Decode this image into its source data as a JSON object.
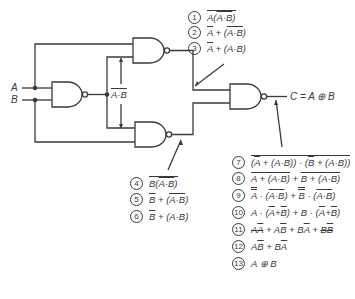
{
  "diagram": {
    "type": "logic-circuit",
    "inputs": [
      {
        "label": "A"
      },
      {
        "label": "B"
      }
    ],
    "intermediate_label": "A·B (overbar)",
    "output_label": "C = A ⊕ B",
    "gates": [
      {
        "id": "g1",
        "type": "NAND",
        "inputs": [
          "A",
          "B"
        ],
        "output": "NOT(A·B)"
      },
      {
        "id": "g2",
        "type": "NAND",
        "inputs": [
          "A",
          "NOT(A·B)"
        ]
      },
      {
        "id": "g3",
        "type": "NAND",
        "inputs": [
          "NOT(A·B)",
          "B"
        ]
      },
      {
        "id": "g4",
        "type": "NAND",
        "inputs": [
          "g2",
          "g3"
        ],
        "output": "C"
      }
    ],
    "steps": [
      {
        "n": "1",
        "text": "A(A·B) with overbars"
      },
      {
        "n": "2",
        "text": "Ā + (A·B double-bar)"
      },
      {
        "n": "3",
        "text": "Ā + (A·B)"
      },
      {
        "n": "4",
        "text": "B(A·B bar) with overbar"
      },
      {
        "n": "5",
        "text": "B̄ + (A·B double-bar)"
      },
      {
        "n": "6",
        "text": "B̄ + (A·B)"
      },
      {
        "n": "7",
        "text": "(Ā + (A·B))·(B̄ + (A·B)) overbar"
      },
      {
        "n": "8",
        "text": "Ā + (A·B) bar + B̄ + (A·B) bar"
      },
      {
        "n": "9",
        "text": "Ā̄·(A·B bar) + B̄̄·(A·B bar)"
      },
      {
        "n": "10",
        "text": "A·(Ā+B̄) + B·(Ā+B̄)"
      },
      {
        "n": "11",
        "text": "AĀ + AB̄ + BĀ + BB̄"
      },
      {
        "n": "12",
        "text": "AB̄ + BĀ"
      },
      {
        "n": "13",
        "text": "A ⊕ B"
      }
    ]
  },
  "labels": {
    "A": "A",
    "B": "B",
    "C": "C = A ⊕ B",
    "nums": [
      "1",
      "2",
      "3",
      "4",
      "5",
      "6",
      "7",
      "8",
      "9",
      "10",
      "11",
      "12",
      "13"
    ]
  }
}
